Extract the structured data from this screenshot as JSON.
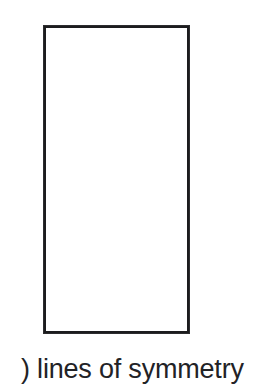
{
  "page": {
    "background_color": "#ffffff",
    "width": 260,
    "height": 390
  },
  "figure": {
    "shape_name": "rectangle",
    "stroke_color": "#1c1c1e",
    "fill_color": "#ffffff",
    "stroke_width_px": 3,
    "left_px": 43,
    "top_px": 25,
    "width_px": 147,
    "height_px": 309,
    "symmetry_lines_drawn": 0
  },
  "caption": {
    "text": ") lines of symmetry",
    "color": "#222226"
  }
}
